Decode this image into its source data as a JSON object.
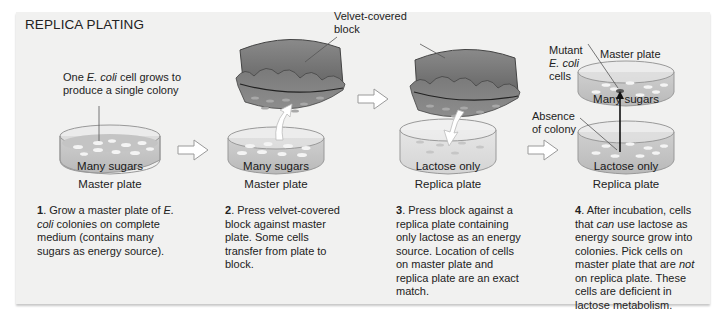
{
  "title": "REPLICA PLATING",
  "colors": {
    "panel_bg": "#f1f1f0",
    "plate_medium": "#c9c9c9",
    "colony": "#f4f4f4",
    "block": "#6e6e6e",
    "arrow_outline": "#9a9a9a"
  },
  "step1": {
    "annotation_pre": "One ",
    "annotation_italic": "E. coli",
    "annotation_post": " cell grows to produce a single colony",
    "medium_label": "Many sugars",
    "plate_label": "Master plate",
    "number": "1",
    "text_a": ". Grow a master plate of ",
    "text_italic": "E. coli",
    "text_b": " colonies on complete medium (contains many sugars as energy source)."
  },
  "step2": {
    "block_label": "Velvet-covered block",
    "medium_label": "Many sugars",
    "plate_label": "Master plate",
    "number": "2",
    "text": ". Press velvet-covered block against master plate. Some cells transfer from plate to block."
  },
  "step3": {
    "medium_label": "Lactose only",
    "plate_label": "Replica plate",
    "number": "3",
    "text": ". Press block against a replica plate containing only lactose as an energy source. Location of cells on master plate and replica plate are an exact match."
  },
  "step4": {
    "mutant_label_a": "Mutant",
    "mutant_label_italic": "E. coli",
    "mutant_label_b": "cells",
    "master_plate_label": "Master plate",
    "master_medium_label": "Many sugars",
    "absence_label": "Absence of colony",
    "replica_medium_label": "Lactose only",
    "replica_plate_label": "Replica plate",
    "number": "4",
    "text_a": ". After incubation, cells that ",
    "text_italic1": "can",
    "text_b": " use lactose as energy source grow into colonies. Pick cells on master plate that are ",
    "text_italic2": "not",
    "text_c": " on replica plate. These cells are deficient in lactose metabolism."
  }
}
